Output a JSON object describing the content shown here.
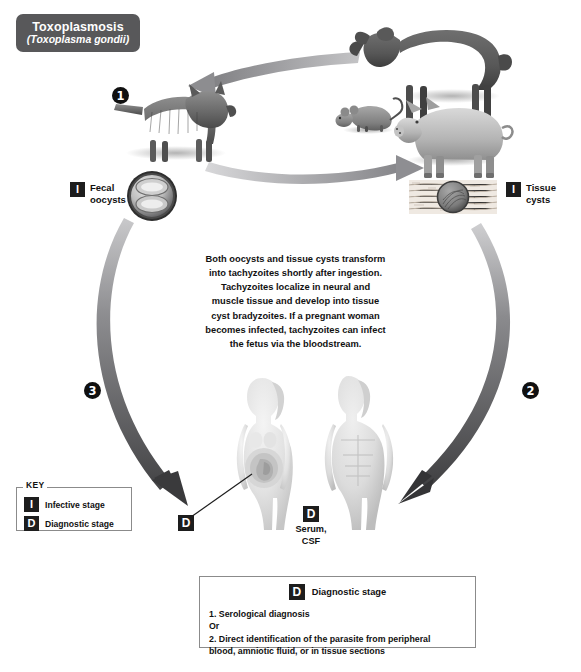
{
  "title": {
    "name": "Toxoplasmosis",
    "scientific_name": "(Toxoplasma gondii)"
  },
  "labels": {
    "fecal_oocysts": "Fecal\noocysts",
    "fecal_oocysts_line1": "Fecal",
    "fecal_oocysts_line2": "oocysts",
    "tissue_cysts_line1": "Tissue",
    "tissue_cysts_line2": "cysts",
    "infective_badge": "I",
    "diagnostic_badge": "D",
    "serum_csf_line1": "Serum,",
    "serum_csf_line2": "CSF"
  },
  "steps": [
    {
      "number": "1",
      "description": "Cat definitive host sheds oocysts"
    },
    {
      "number": "2",
      "description": "Tissue cysts ingested by humans"
    },
    {
      "number": "3",
      "description": "Fecal oocysts ingested by humans"
    }
  ],
  "center_note": "Both oocysts and tissue cysts transform into tachyzoites shortly after ingestion. Tachyzoites localize in neural and muscle tissue and develop into tissue cyst bradyzoites. If a pregnant woman becomes infected, tachyzoites can infect the fetus via the bloodstream.",
  "center_note_lines": [
    "Both oocysts and tissue cysts transform",
    "into tachyzoites shortly after ingestion.",
    "Tachyzoites localize in neural and",
    "muscle tissue and develop into tissue",
    "cyst bradyzoites. If a pregnant woman",
    "becomes infected, tachyzoites can infect",
    "the fetus via the bloodstream."
  ],
  "key_box": {
    "title": "KEY",
    "items": [
      {
        "badge": "I",
        "label": "Infective stage"
      },
      {
        "badge": "D",
        "label": "Diagnostic stage"
      }
    ]
  },
  "diagnostic_box": {
    "badge": "D",
    "heading": "Diagnostic stage",
    "lines": [
      "1. Serological diagnosis",
      "Or",
      "2. Direct identification of the parasite from peripheral",
      "blood, amniotic fluid, or in tissue sections"
    ]
  },
  "illustrations": {
    "cat": "cat",
    "sheep": "sheep",
    "mouse": "mouse",
    "pig": "pig",
    "oocyst": "oocyst-micrograph",
    "tissue_cyst": "tissue-cyst-micrograph",
    "pregnant_woman": "pregnant-woman-figure",
    "man": "man-figure",
    "fetus": "fetus"
  },
  "colors": {
    "title_badge_bg": "#58585a",
    "title_text": "#ffffff",
    "badge_bg": "#1d1d1d",
    "arrow_dark": "#4a4a4c",
    "arrow_light": "#9c9c9e",
    "box_border": "#8b8b8b",
    "text": "#111111",
    "background": "#ffffff"
  }
}
